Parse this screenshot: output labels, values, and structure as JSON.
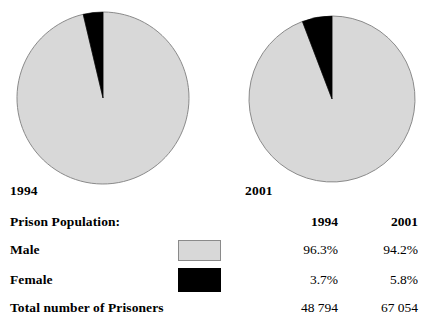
{
  "chart_data": [
    {
      "type": "pie",
      "title": "1994",
      "categories": [
        "Male",
        "Female"
      ],
      "values": [
        96.3,
        3.7
      ],
      "value_unit": "%",
      "total_label": "Total number of Prisoners",
      "total": "48 794",
      "colors": [
        "#d8d8d8",
        "#000000"
      ],
      "start_angle_deg": 0,
      "direction": "clockwise",
      "legend": "external-table",
      "grid": false
    },
    {
      "type": "pie",
      "title": "2001",
      "categories": [
        "Male",
        "Female"
      ],
      "values": [
        94.2,
        5.8
      ],
      "value_unit": "%",
      "total_label": "Total number of Prisoners",
      "total": "67 054",
      "colors": [
        "#d8d8d8",
        "#000000"
      ],
      "start_angle_deg": 0,
      "direction": "clockwise",
      "legend": "external-table",
      "grid": false
    }
  ],
  "pies": {
    "left": {
      "year_label": "1994",
      "male_pct": 96.3,
      "female_pct": 3.7
    },
    "right": {
      "year_label": "2001",
      "male_pct": 94.2,
      "female_pct": 5.8
    }
  },
  "table": {
    "header": {
      "title": "Prison Population:",
      "col1": "1994",
      "col2": "2001"
    },
    "rows": [
      {
        "label": "Male",
        "swatch": "male-gray-swatch",
        "v1994": "96.3%",
        "v2001": "94.2%"
      },
      {
        "label": "Female",
        "swatch": "female-black-swatch",
        "v1994": "3.7%",
        "v2001": "5.8%"
      }
    ],
    "total": {
      "label": "Total number of Prisoners",
      "v1994": "48 794",
      "v2001": "67 054"
    }
  },
  "colors": {
    "male": "#d8d8d8",
    "female": "#000000",
    "outline": "#8a8a8a",
    "text": "#000000",
    "background": "#ffffff"
  }
}
